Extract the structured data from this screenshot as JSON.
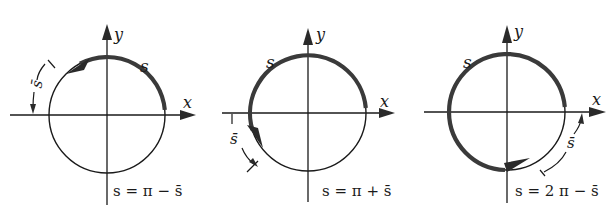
{
  "figure": {
    "panels": [
      {
        "id": "panel-1",
        "axis_x_label": "x",
        "axis_y_label": "y",
        "arc_label": "s",
        "offset_label": "s̄",
        "equation": "s = π − s̄",
        "arc_from_deg": 5,
        "arc_to_deg": 128,
        "quadrant": "II"
      },
      {
        "id": "panel-2",
        "axis_x_label": "x",
        "axis_y_label": "y",
        "arc_label": "s",
        "offset_label": "s̄",
        "equation": "s = π + s̄",
        "arc_from_deg": 5,
        "arc_to_deg": 235,
        "quadrant": "III"
      },
      {
        "id": "panel-3",
        "axis_x_label": "x",
        "axis_y_label": "y",
        "arc_label": "s",
        "offset_label": "s̄",
        "equation": "s = 2 π − s̄",
        "arc_from_deg": 5,
        "arc_to_deg": 290,
        "quadrant": "IV"
      }
    ]
  }
}
